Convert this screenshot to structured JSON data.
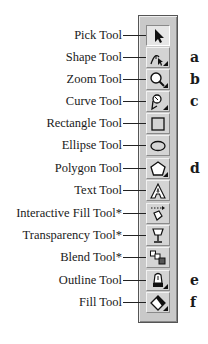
{
  "toolbox": {
    "tools": [
      {
        "label": "Pick Tool",
        "icon": "arrow-pointer-icon",
        "letter": "",
        "flyout": false,
        "active": true
      },
      {
        "label": "Shape Tool",
        "icon": "shape-node-icon",
        "letter": "a",
        "flyout": true,
        "active": false
      },
      {
        "label": "Zoom Tool",
        "icon": "magnifier-icon",
        "letter": "b",
        "flyout": true,
        "active": false
      },
      {
        "label": "Curve Tool",
        "icon": "pen-curve-icon",
        "letter": "c",
        "flyout": true,
        "active": false
      },
      {
        "label": "Rectangle Tool",
        "icon": "rectangle-icon",
        "letter": "",
        "flyout": false,
        "active": false
      },
      {
        "label": "Ellipse Tool",
        "icon": "ellipse-icon",
        "letter": "",
        "flyout": false,
        "active": false
      },
      {
        "label": "Polygon Tool",
        "icon": "polygon-icon",
        "letter": "d",
        "flyout": true,
        "active": false
      },
      {
        "label": "Text Tool",
        "icon": "text-a-icon",
        "letter": "",
        "flyout": false,
        "active": false
      },
      {
        "label": "Interactive Fill Tool*",
        "icon": "interactive-fill-icon",
        "letter": "",
        "flyout": false,
        "active": false
      },
      {
        "label": "Transparency Tool*",
        "icon": "wine-glass-icon",
        "letter": "",
        "flyout": false,
        "active": false
      },
      {
        "label": "Blend Tool*",
        "icon": "blend-squares-icon",
        "letter": "",
        "flyout": false,
        "active": false
      },
      {
        "label": "Outline Tool",
        "icon": "pen-nib-icon",
        "letter": "e",
        "flyout": true,
        "active": false
      },
      {
        "label": "Fill Tool",
        "icon": "paint-bucket-icon",
        "letter": "f",
        "flyout": true,
        "active": false
      }
    ]
  }
}
